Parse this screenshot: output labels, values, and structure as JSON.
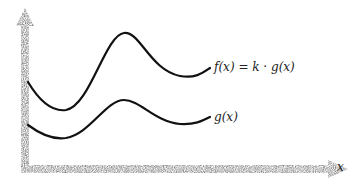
{
  "diagram": {
    "curves": [
      {
        "id": "f",
        "label": "f(x) = k · g(x)"
      },
      {
        "id": "g",
        "label": "g(x)"
      }
    ],
    "x_axis_label": "x",
    "colors": {
      "curve": "#111111",
      "axis": "#888888"
    }
  }
}
